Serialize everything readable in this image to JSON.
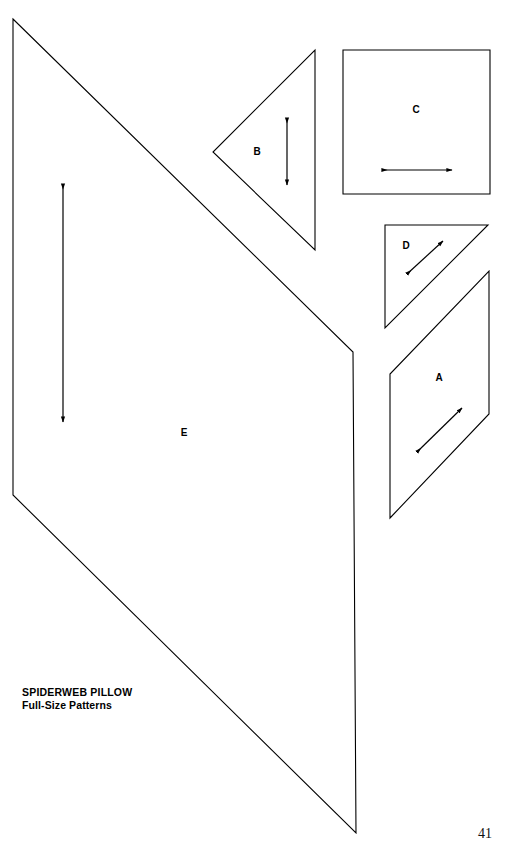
{
  "document": {
    "caption_title": "SPIDERWEB PILLOW",
    "caption_subtitle": "Full-Size Patterns",
    "page_number": "41",
    "ink_color": "#000000",
    "paper_color": "#ffffff"
  },
  "pieces": [
    {
      "id": "E",
      "label": "E",
      "shape": "quadrilateral",
      "points": "13,19 353,352 356,833 13,495",
      "label_x": 184,
      "label_y": 433,
      "grain": {
        "direction": "vertical",
        "x1": 63,
        "y1": 184,
        "x2": 63,
        "y2": 422
      }
    },
    {
      "id": "B",
      "label": "B",
      "shape": "triangle",
      "points": "315,50 315,250 213,152",
      "label_x": 257,
      "label_y": 152,
      "grain": {
        "direction": "vertical",
        "x1": 287,
        "y1": 118,
        "x2": 287,
        "y2": 185
      }
    },
    {
      "id": "C",
      "label": "C",
      "shape": "square",
      "points": "343,50 490,50 490,194 343,194",
      "label_x": 416,
      "label_y": 110,
      "grain": {
        "direction": "horizontal",
        "x1": 382,
        "y1": 170,
        "x2": 452,
        "y2": 170
      }
    },
    {
      "id": "D",
      "label": "D",
      "shape": "triangle",
      "points": "385,225 488,225 385,328",
      "label_x": 406,
      "label_y": 246,
      "grain": {
        "direction": "diagonal",
        "x1": 407,
        "y1": 274,
        "x2": 443,
        "y2": 241
      }
    },
    {
      "id": "A",
      "label": "A",
      "shape": "parallelogram",
      "points": "489,271 489,414 390,518 390,374",
      "label_x": 439,
      "label_y": 378,
      "grain": {
        "direction": "diagonal",
        "x1": 417,
        "y1": 452,
        "x2": 462,
        "y2": 408
      }
    }
  ]
}
